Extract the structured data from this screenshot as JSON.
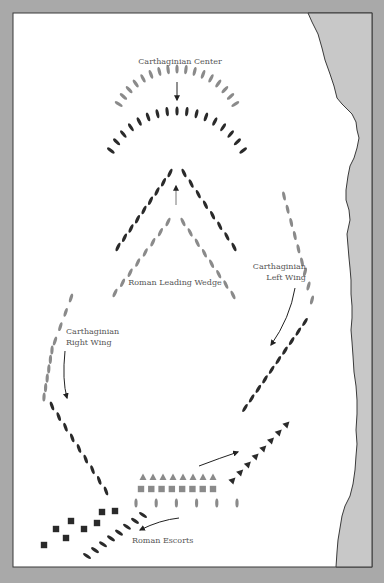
{
  "colors": {
    "frame": "#a9a9a9",
    "panel": "#ffffff",
    "sea": "#c8c8c8",
    "border_line": "#3a3a3a",
    "dark_unit": "#2a2a2a",
    "gray_unit": "#8a8a8a",
    "arrow": "#222222"
  },
  "labels": {
    "carthaginian_center": "Carthaginian Center",
    "roman_leading_wedge": "Roman Leading Wedge",
    "carthaginian_left_wing_line1": "Carthaginian",
    "carthaginian_left_wing_line2": "Left Wing",
    "carthaginian_right_wing_line1": "Carthaginian",
    "carthaginian_right_wing_line2": "Right Wing",
    "roman_escorts": "Roman Escorts"
  },
  "formations": [
    {
      "name": "carthaginian-center-front",
      "side": "Carthaginian",
      "shape": "ship",
      "tone": "gray",
      "count": 17
    },
    {
      "name": "carthaginian-center-back",
      "side": "Carthaginian",
      "shape": "ship",
      "tone": "dark",
      "count": 17
    },
    {
      "name": "roman-wedge-front",
      "side": "Roman",
      "shape": "ship",
      "tone": "dark",
      "count": 17
    },
    {
      "name": "roman-wedge-rear",
      "side": "Roman",
      "shape": "ship",
      "tone": "gray",
      "count": 16
    },
    {
      "name": "carthaginian-left-wing-upper",
      "side": "Carthaginian",
      "shape": "ship",
      "tone": "gray",
      "count": 9
    },
    {
      "name": "carthaginian-left-wing-lower",
      "side": "Carthaginian",
      "shape": "ship",
      "tone": "dark",
      "count": 10
    },
    {
      "name": "carthaginian-right-wing-upper",
      "side": "Carthaginian",
      "shape": "ship",
      "tone": "gray",
      "count": 10
    },
    {
      "name": "carthaginian-right-wing-lower",
      "side": "Carthaginian",
      "shape": "ship",
      "tone": "dark",
      "count": 9
    },
    {
      "name": "roman-transports-triangles",
      "side": "Roman",
      "shape": "triangle",
      "tone": "gray",
      "count": 8
    },
    {
      "name": "roman-transports-squares",
      "side": "Roman",
      "shape": "square",
      "tone": "gray",
      "count": 8
    },
    {
      "name": "roman-rear-line",
      "side": "Roman",
      "shape": "ship",
      "tone": "gray",
      "count": 6
    },
    {
      "name": "roman-triangles-right",
      "side": "Roman",
      "shape": "triangle",
      "tone": "dark",
      "count": 8
    },
    {
      "name": "roman-escorts-squares",
      "side": "Roman",
      "shape": "square",
      "tone": "dark",
      "count": 8
    },
    {
      "name": "roman-escorts-ships",
      "side": "Roman",
      "shape": "ship",
      "tone": "dark",
      "count": 8
    }
  ]
}
